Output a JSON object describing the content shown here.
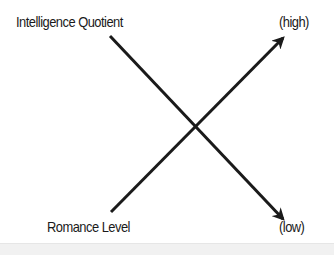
{
  "diagram": {
    "type": "crossing-lines",
    "labels": {
      "top_left": "Intelligence Quotient",
      "bottom_left": "Romance Level",
      "top_right": "(high)",
      "bottom_right": "(low)"
    },
    "lines": [
      {
        "name": "intelligence-quotient",
        "from_label": "Intelligence Quotient",
        "to_label": "(low)",
        "direction": "decreasing",
        "start": [
          110,
          36
        ],
        "end": [
          285,
          221
        ]
      },
      {
        "name": "romance-level",
        "from_label": "Romance Level",
        "to_label": "(high)",
        "direction": "increasing",
        "start": [
          111,
          212
        ],
        "end": [
          285,
          36
        ]
      }
    ],
    "colors": {
      "line": "#1a1a1a",
      "text": "#1a1a1a",
      "background": "#ffffff",
      "footer": "#f1f1f1"
    }
  }
}
